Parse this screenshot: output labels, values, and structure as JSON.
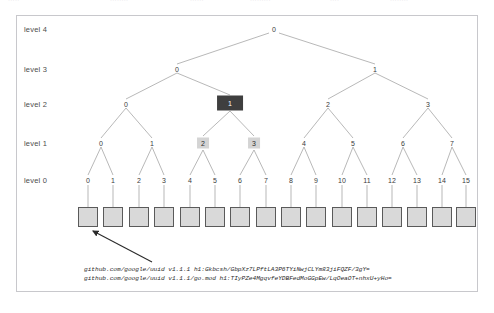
{
  "top_strip": {
    "fragments": [
      {
        "text": "·····",
        "x": 8
      },
      {
        "text": "········",
        "x": 110
      },
      {
        "text": "······",
        "x": 190
      },
      {
        "text": "·········",
        "x": 250
      },
      {
        "text": "····",
        "x": 330
      },
      {
        "text": "········",
        "x": 390
      }
    ]
  },
  "diagram": {
    "levels": [
      {
        "label": "level 4",
        "y": 29
      },
      {
        "label": "level 3",
        "y": 69
      },
      {
        "label": "level 2",
        "y": 104
      },
      {
        "label": "level 1",
        "y": 143
      },
      {
        "label": "level 0",
        "y": 180
      }
    ],
    "nodes_level4": [
      {
        "label": "0",
        "x": 274,
        "y": 29
      }
    ],
    "nodes_level3": [
      {
        "label": "0",
        "x": 177,
        "y": 69
      },
      {
        "label": "1",
        "x": 375,
        "y": 69
      }
    ],
    "nodes_level2": [
      {
        "label": "0",
        "x": 126,
        "y": 104,
        "highlight": "none"
      },
      {
        "label": "1",
        "x": 230,
        "y": 103,
        "highlight": "dark"
      },
      {
        "label": "2",
        "x": 328,
        "y": 104,
        "highlight": "none"
      },
      {
        "label": "3",
        "x": 428,
        "y": 104,
        "highlight": "none"
      }
    ],
    "nodes_level1": [
      {
        "label": "0",
        "x": 101,
        "y": 143,
        "highlight": "none"
      },
      {
        "label": "1",
        "x": 152,
        "y": 143,
        "highlight": "none"
      },
      {
        "label": "2",
        "x": 203,
        "y": 143,
        "highlight": "light"
      },
      {
        "label": "3",
        "x": 254,
        "y": 143,
        "highlight": "light"
      },
      {
        "label": "4",
        "x": 304,
        "y": 143,
        "highlight": "none"
      },
      {
        "label": "5",
        "x": 353,
        "y": 143,
        "highlight": "none"
      },
      {
        "label": "6",
        "x": 403,
        "y": 143,
        "highlight": "none"
      },
      {
        "label": "7",
        "x": 452,
        "y": 143,
        "highlight": "none"
      }
    ],
    "leaves": [
      {
        "label": "0",
        "x": 88
      },
      {
        "label": "1",
        "x": 113
      },
      {
        "label": "2",
        "x": 139
      },
      {
        "label": "3",
        "x": 164
      },
      {
        "label": "4",
        "x": 190
      },
      {
        "label": "5",
        "x": 215
      },
      {
        "label": "6",
        "x": 240
      },
      {
        "label": "7",
        "x": 266
      },
      {
        "label": "8",
        "x": 291
      },
      {
        "label": "9",
        "x": 316
      },
      {
        "label": "10",
        "x": 342
      },
      {
        "label": "11",
        "x": 367
      },
      {
        "label": "12",
        "x": 392
      },
      {
        "label": "13",
        "x": 417
      },
      {
        "label": "14",
        "x": 442
      },
      {
        "label": "15",
        "x": 466
      }
    ],
    "leaf_label_y": 180,
    "leaf_box_y": 207,
    "colors": {
      "node_highlight_dark": "#3f3f3f",
      "node_highlight_light": "#d4d4d4",
      "leaf_box_fill": "#d9d9d9",
      "leaf_box_stroke": "#5a5a5a",
      "edge": "#999999",
      "panel_border": "#c8c8cc"
    }
  },
  "annotation": {
    "arrow_from": {
      "x": 152,
      "y": 262
    },
    "arrow_to": {
      "x": 93,
      "y": 231
    },
    "lines": [
      "github.com/google/uuid v1.1.1 h1:Gkbcsh/GbpXz7LPftLA3P6TYiNwjCLYm83jiFQZF/3gY=",
      "github.com/google/uuid v1.1.1/go.mod h1:TIyPZe4MgqvfeYDBFedMoGGpEw/LqOeaOT+nhxU+yHo="
    ],
    "line_positions": [
      {
        "x": 84,
        "y": 266
      },
      {
        "x": 84,
        "y": 275
      }
    ]
  }
}
